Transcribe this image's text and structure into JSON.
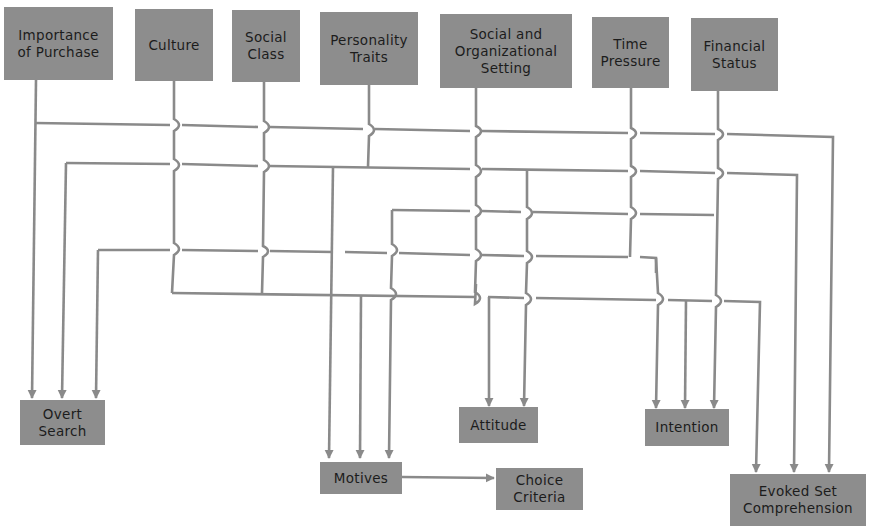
{
  "diagram": {
    "type": "influence-flow",
    "line_color": "#8a8a8a",
    "box_color": "#8d8d8d",
    "text_color": "#1c1c1c",
    "sources": [
      {
        "id": "importance",
        "label": "Importance\nof Purchase"
      },
      {
        "id": "culture",
        "label": "Culture"
      },
      {
        "id": "social_class",
        "label": "Social\nClass"
      },
      {
        "id": "personality",
        "label": "Personality\nTraits"
      },
      {
        "id": "social_org",
        "label": "Social and\nOrganizational\nSetting"
      },
      {
        "id": "time_pressure",
        "label": "Time\nPressure"
      },
      {
        "id": "financial",
        "label": "Financial\nStatus"
      }
    ],
    "targets": [
      {
        "id": "overt_search",
        "label": "Overt\nSearch"
      },
      {
        "id": "motives",
        "label": "Motives"
      },
      {
        "id": "choice_criteria",
        "label": "Choice\nCriteria"
      },
      {
        "id": "attitude",
        "label": "Attitude"
      },
      {
        "id": "intention",
        "label": "Intention"
      },
      {
        "id": "evoked_set",
        "label": "Evoked Set\nComprehension"
      }
    ],
    "edges": [
      {
        "from": "importance",
        "to": "overt_search"
      },
      {
        "from": "importance",
        "to": "evoked_set"
      },
      {
        "from": "culture",
        "to": "overt_search"
      },
      {
        "from": "social_class",
        "to": "overt_search"
      },
      {
        "from": "time_pressure",
        "to": "overt_search"
      },
      {
        "from": "financial",
        "to": "evoked_set"
      },
      {
        "from": "culture",
        "to": "evoked_set"
      },
      {
        "from": "personality",
        "to": "motives"
      },
      {
        "from": "social_org",
        "to": "motives"
      },
      {
        "from": "culture",
        "to": "motives"
      },
      {
        "from": "social_class",
        "to": "motives"
      },
      {
        "from": "social_org",
        "to": "attitude"
      },
      {
        "from": "culture",
        "to": "attitude"
      },
      {
        "from": "time_pressure",
        "to": "intention"
      },
      {
        "from": "financial",
        "to": "intention"
      },
      {
        "from": "culture",
        "to": "intention"
      },
      {
        "from": "motives",
        "to": "choice_criteria"
      }
    ]
  }
}
